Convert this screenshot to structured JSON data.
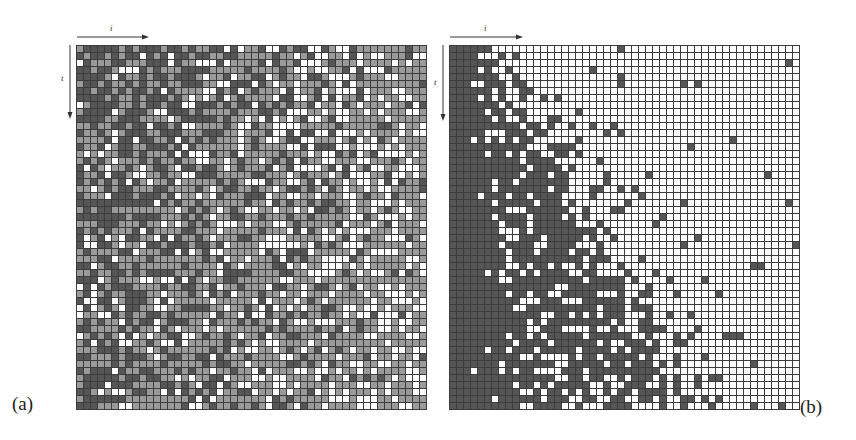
{
  "figure": {
    "panels": [
      {
        "id": "a",
        "label": "(a)",
        "label_pos": {
          "left": 12,
          "top": 393
        },
        "grid": {
          "left": 76,
          "top": 45,
          "cols": 50,
          "rows": 52,
          "cell": 7
        },
        "mode": "three-level",
        "colors": {
          "dark": "#555555",
          "mid": "#9a9a9a",
          "light": "#ffffff"
        },
        "seed": 1337,
        "x_axis": {
          "label": "i",
          "arrow": {
            "x1": 77,
            "x2": 148,
            "y": 37
          },
          "label_pos": {
            "left": 110,
            "top": 23
          }
        },
        "t_axis": {
          "label": "t",
          "arrow": {
            "x": 70,
            "y1": 45,
            "y2": 118
          },
          "label_pos": {
            "left": 61,
            "top": 73
          }
        }
      },
      {
        "id": "b",
        "label": "(b)",
        "label_pos": {
          "left": 800,
          "top": 396
        },
        "grid": {
          "left": 449,
          "top": 45,
          "cols": 50,
          "rows": 52,
          "cell": 7
        },
        "mode": "two-level-front",
        "colors": {
          "dark": "#555555",
          "light": "#ffffff"
        },
        "seed": 4242,
        "x_axis": {
          "label": "i",
          "arrow": {
            "x1": 450,
            "x2": 522,
            "y": 37
          },
          "label_pos": {
            "left": 484,
            "top": 23
          }
        },
        "t_axis": {
          "label": "t",
          "arrow": {
            "x": 443,
            "y1": 45,
            "y2": 120
          },
          "label_pos": {
            "left": 434,
            "top": 77
          }
        }
      }
    ]
  }
}
